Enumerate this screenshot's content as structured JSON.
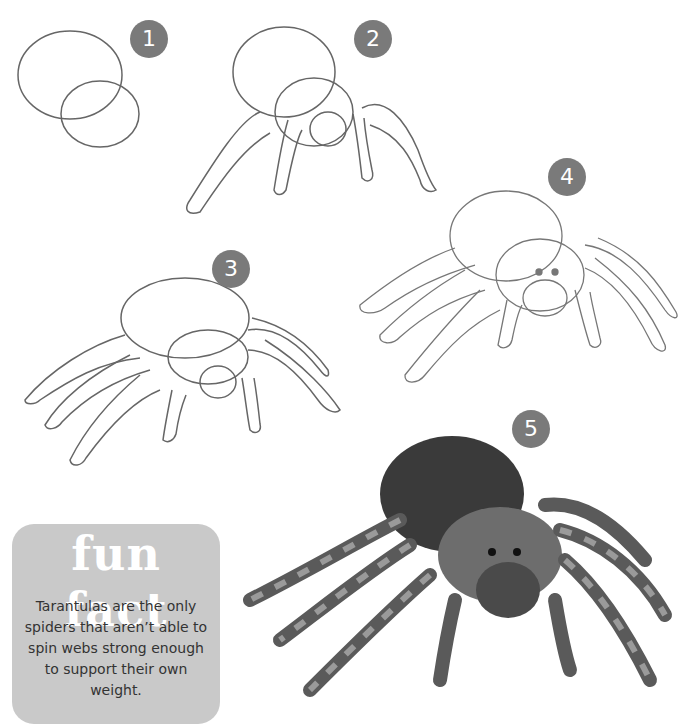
{
  "steps": [
    {
      "number": "1",
      "label": "Step 1"
    },
    {
      "number": "2",
      "label": "Step 2"
    },
    {
      "number": "3",
      "label": "Step 3"
    },
    {
      "number": "4",
      "label": "Step 4"
    },
    {
      "number": "5",
      "label": "Step 5"
    }
  ],
  "fun_fact": {
    "title": "fun fact",
    "text": "Tarantulas are the only spiders that aren’t able to spin webs strong enough to support their own weight."
  },
  "colors": {
    "badge": "#7a7a7a",
    "fact_box": "#c9c9c9",
    "pencil": "#555555"
  }
}
